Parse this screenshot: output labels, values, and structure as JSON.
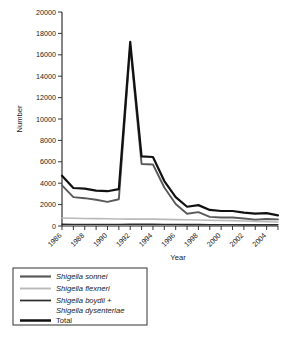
{
  "chart_data": {
    "type": "line",
    "title": "",
    "xlabel": "Year",
    "ylabel": "Number",
    "x": [
      1986,
      1987,
      1988,
      1989,
      1990,
      1991,
      1992,
      1993,
      1994,
      1995,
      1996,
      1997,
      1998,
      1999,
      2000,
      2001,
      2002,
      2003,
      2004,
      2005
    ],
    "xlim": [
      1986,
      2005
    ],
    "ylim": [
      0,
      20000
    ],
    "ytick_step": 2000,
    "xtick_step": 1,
    "xtick_label_step": 2,
    "grid": false,
    "legend_position": "below-left",
    "yticks": [
      "0",
      "2000",
      "4000",
      "6000",
      "8000",
      "10000",
      "12000",
      "14000",
      "16000",
      "18000",
      "20000"
    ],
    "xticks": [
      "1986",
      "1988",
      "1990",
      "1992",
      "1994",
      "1996",
      "1998",
      "2000",
      "2002",
      "2004"
    ],
    "series": [
      {
        "name": "Shigella sonnei",
        "italic": true,
        "color": "#5a5a5a",
        "width": 1.9,
        "values": [
          3800,
          2700,
          2600,
          2450,
          2250,
          2500,
          16800,
          5800,
          5750,
          3600,
          2050,
          1150,
          1300,
          850,
          800,
          800,
          700,
          600,
          650,
          620
        ]
      },
      {
        "name": "Shigella flexneri",
        "italic": true,
        "color": "#b9b9b9",
        "width": 1.6,
        "values": [
          750,
          720,
          700,
          690,
          680,
          660,
          640,
          640,
          640,
          620,
          600,
          580,
          560,
          540,
          520,
          500,
          470,
          430,
          400,
          380
        ]
      },
      {
        "name": "Shigella boydii + Shigella dysenteriae",
        "italic": true,
        "color": "#2b2b2b",
        "width": 1.4,
        "values": [
          160,
          150,
          150,
          150,
          150,
          150,
          170,
          160,
          160,
          150,
          150,
          140,
          140,
          130,
          130,
          125,
          120,
          115,
          110,
          110
        ]
      },
      {
        "name": "Total",
        "italic": false,
        "color": "#111111",
        "width": 2.2,
        "values": [
          4700,
          3550,
          3500,
          3300,
          3250,
          3450,
          17200,
          6500,
          6450,
          4200,
          2700,
          1800,
          1950,
          1500,
          1400,
          1400,
          1250,
          1150,
          1200,
          1000
        ]
      }
    ]
  },
  "legend": {
    "entries": [
      {
        "label": "Shigella sonnei",
        "label2": ""
      },
      {
        "label": "Shigella flexneri",
        "label2": ""
      },
      {
        "label": "Shigella boydii +",
        "label2": "Shigella dysenteriae"
      },
      {
        "label": "Total",
        "label2": ""
      }
    ]
  }
}
